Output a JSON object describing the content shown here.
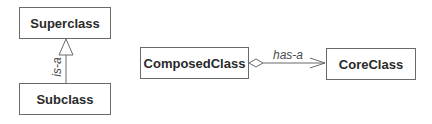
{
  "diagram": {
    "type": "uml-class-diagram",
    "classes": {
      "superclass": {
        "name": "Superclass"
      },
      "subclass": {
        "name": "Subclass"
      },
      "composed": {
        "name": "ComposedClass"
      },
      "core": {
        "name": "CoreClass"
      }
    },
    "relationships": {
      "inheritance": {
        "from": "Subclass",
        "to": "Superclass",
        "kind": "generalization",
        "label": "is-a"
      },
      "aggregation": {
        "from": "ComposedClass",
        "to": "CoreClass",
        "kind": "aggregation",
        "label": "has-a"
      }
    },
    "colors": {
      "line": "#6a6a6a",
      "text": "#2a2a2a",
      "label": "#4a4a4a",
      "background": "#ffffff"
    }
  }
}
